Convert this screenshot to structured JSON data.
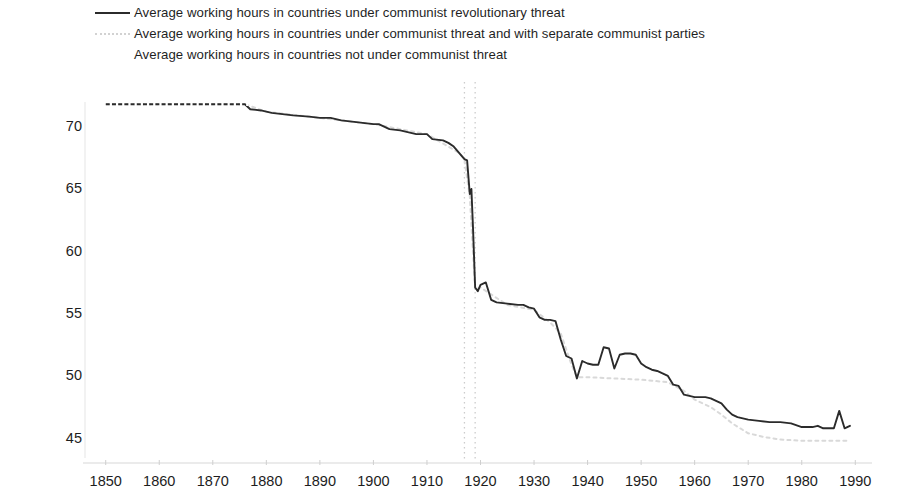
{
  "legend": {
    "position": "top-left",
    "items": [
      {
        "label": "Average working hours in countries under communist revolutionary threat",
        "key": "solid",
        "color": "#2b2b2b"
      },
      {
        "label": "Average working hours in countries under communist threat and with separate communist parties",
        "key": "dotted",
        "color": "#d2d2d2"
      },
      {
        "label": "Average working hours in countries not under communist threat",
        "key": "none",
        "color": "#ffffff"
      }
    ]
  },
  "axes": {
    "y_ticks": [
      "45",
      "50",
      "55",
      "60",
      "65",
      "70"
    ],
    "x_ticks": [
      "1850",
      "1860",
      "1870",
      "1880",
      "1890",
      "1900",
      "1910",
      "1920",
      "1930",
      "1940",
      "1950",
      "1960",
      "1970",
      "1980",
      "1990"
    ],
    "xlim": [
      1848,
      1992
    ],
    "ylim": [
      44.0,
      73.2
    ],
    "grid": "vertical-dotted-markers-only",
    "vertical_markers": [
      1917,
      1919
    ]
  },
  "chart_data": {
    "type": "line",
    "title": "",
    "subtitle": "",
    "xlabel": "",
    "ylabel": "",
    "xlim": [
      1848,
      1992
    ],
    "ylim": [
      44.0,
      73.2
    ],
    "grid": false,
    "legend_position": "top-left",
    "annotations": [
      {
        "type": "vline",
        "x": 1917,
        "style": "dotted",
        "color": "#cccccc"
      },
      {
        "type": "vline",
        "x": 1919,
        "style": "dotted",
        "color": "#cccccc"
      }
    ],
    "series": [
      {
        "name": "Average working hours in countries under communist revolutionary threat",
        "style": "solid",
        "color": "#2b2b2b",
        "points": [
          [
            1850,
            71.9
          ],
          [
            1855,
            71.9
          ],
          [
            1860,
            71.9
          ],
          [
            1865,
            71.9
          ],
          [
            1870,
            71.9
          ],
          [
            1874,
            71.9
          ],
          [
            1876,
            71.9
          ],
          [
            1877,
            71.5
          ],
          [
            1879,
            71.4
          ],
          [
            1881,
            71.2
          ],
          [
            1883,
            71.1
          ],
          [
            1885,
            71.0
          ],
          [
            1888,
            70.9
          ],
          [
            1890,
            70.8
          ],
          [
            1892,
            70.8
          ],
          [
            1894,
            70.6
          ],
          [
            1896,
            70.5
          ],
          [
            1898,
            70.4
          ],
          [
            1900,
            70.3
          ],
          [
            1901,
            70.3
          ],
          [
            1903,
            69.9
          ],
          [
            1905,
            69.8
          ],
          [
            1907,
            69.6
          ],
          [
            1908,
            69.5
          ],
          [
            1910,
            69.5
          ],
          [
            1911,
            69.1
          ],
          [
            1913,
            69.0
          ],
          [
            1914,
            68.8
          ],
          [
            1915,
            68.5
          ],
          [
            1916,
            68.0
          ],
          [
            1917,
            67.5
          ],
          [
            1917.5,
            67.4
          ],
          [
            1918,
            64.7
          ],
          [
            1918.3,
            65.1
          ],
          [
            1918.6,
            62.0
          ],
          [
            1919,
            57.2
          ],
          [
            1919.5,
            56.9
          ],
          [
            1920,
            57.4
          ],
          [
            1921,
            57.6
          ],
          [
            1922,
            56.2
          ],
          [
            1923,
            56.0
          ],
          [
            1925,
            55.9
          ],
          [
            1927,
            55.8
          ],
          [
            1928,
            55.8
          ],
          [
            1929,
            55.6
          ],
          [
            1930,
            55.5
          ],
          [
            1931,
            54.8
          ],
          [
            1932,
            54.6
          ],
          [
            1933,
            54.6
          ],
          [
            1934,
            54.5
          ],
          [
            1935,
            53.0
          ],
          [
            1936,
            51.7
          ],
          [
            1937,
            51.5
          ],
          [
            1938,
            49.9
          ],
          [
            1939,
            51.3
          ],
          [
            1940,
            51.1
          ],
          [
            1941,
            51.0
          ],
          [
            1942,
            51.0
          ],
          [
            1943,
            52.4
          ],
          [
            1944,
            52.3
          ],
          [
            1945,
            50.7
          ],
          [
            1946,
            51.8
          ],
          [
            1947,
            51.9
          ],
          [
            1948,
            51.9
          ],
          [
            1949,
            51.8
          ],
          [
            1950,
            51.1
          ],
          [
            1951,
            50.8
          ],
          [
            1952,
            50.6
          ],
          [
            1953,
            50.5
          ],
          [
            1954,
            50.3
          ],
          [
            1955,
            50.1
          ],
          [
            1956,
            49.4
          ],
          [
            1957,
            49.3
          ],
          [
            1958,
            48.6
          ],
          [
            1959,
            48.5
          ],
          [
            1960,
            48.4
          ],
          [
            1962,
            48.4
          ],
          [
            1963,
            48.3
          ],
          [
            1964,
            48.1
          ],
          [
            1965,
            47.9
          ],
          [
            1966,
            47.4
          ],
          [
            1967,
            47.0
          ],
          [
            1968,
            46.8
          ],
          [
            1970,
            46.6
          ],
          [
            1972,
            46.5
          ],
          [
            1974,
            46.4
          ],
          [
            1976,
            46.4
          ],
          [
            1978,
            46.3
          ],
          [
            1980,
            46.0
          ],
          [
            1982,
            46.0
          ],
          [
            1983,
            46.1
          ],
          [
            1984,
            45.9
          ],
          [
            1985,
            45.9
          ],
          [
            1986,
            45.9
          ],
          [
            1987,
            47.3
          ],
          [
            1988,
            45.9
          ],
          [
            1989,
            46.1
          ]
        ]
      },
      {
        "name": "Average working hours in countries under communist threat and with separate communist parties",
        "style": "dotted",
        "color": "#d9d9d9",
        "points": [
          [
            1850,
            71.9
          ],
          [
            1860,
            71.9
          ],
          [
            1870,
            71.9
          ],
          [
            1876,
            71.9
          ],
          [
            1880,
            71.3
          ],
          [
            1890,
            70.8
          ],
          [
            1900,
            70.3
          ],
          [
            1910,
            69.5
          ],
          [
            1916,
            68.0
          ],
          [
            1917,
            67.5
          ],
          [
            1918,
            64.5
          ],
          [
            1919,
            57.0
          ],
          [
            1920,
            57.2
          ],
          [
            1925,
            55.8
          ],
          [
            1930,
            55.4
          ],
          [
            1933,
            54.4
          ],
          [
            1935,
            53.5
          ],
          [
            1937,
            51.0
          ],
          [
            1938,
            50.0
          ],
          [
            1940,
            50.0
          ],
          [
            1945,
            49.9
          ],
          [
            1950,
            49.8
          ],
          [
            1955,
            49.6
          ],
          [
            1958,
            48.9
          ],
          [
            1960,
            48.2
          ],
          [
            1963,
            47.6
          ],
          [
            1965,
            47.0
          ],
          [
            1967,
            46.3
          ],
          [
            1970,
            45.5
          ],
          [
            1973,
            45.2
          ],
          [
            1976,
            45.0
          ],
          [
            1980,
            44.9
          ],
          [
            1985,
            44.9
          ],
          [
            1989,
            44.9
          ]
        ]
      },
      {
        "name": "Average working hours in countries not under communist threat",
        "style": "invisible",
        "color": "#ffffff",
        "points": []
      }
    ]
  }
}
